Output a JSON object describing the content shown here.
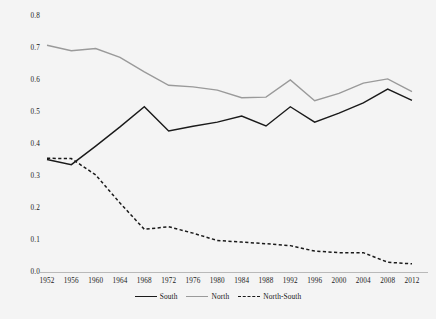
{
  "chart_data": {
    "type": "line",
    "title": "",
    "subtitle": "",
    "xlabel": "",
    "ylabel": "",
    "grid": false,
    "legend_position": "bottom-center",
    "x": [
      1952,
      1956,
      1960,
      1964,
      1968,
      1972,
      1976,
      1980,
      1984,
      1988,
      1992,
      1996,
      2000,
      2004,
      2008,
      2012
    ],
    "categories": [
      "1952",
      "1956",
      "1960",
      "1964",
      "1968",
      "1972",
      "1976",
      "1980",
      "1984",
      "1988",
      "1992",
      "1996",
      "2000",
      "2004",
      "2008",
      "2012"
    ],
    "xlim": [
      1952,
      2012
    ],
    "ylim": [
      0.0,
      0.8
    ],
    "y_ticks": [
      0.0,
      0.1,
      0.2,
      0.3,
      0.4,
      0.5,
      0.6,
      0.7,
      0.8
    ],
    "y_tick_labels": [
      "0.0",
      "0.1",
      "0.2",
      "0.3",
      "0.4",
      "0.5",
      "0.6",
      "0.7",
      "0.8"
    ],
    "series": [
      {
        "name": "South",
        "color": "#1a1a1a",
        "style": "solid",
        "values": [
          0.353,
          0.337,
          0.395,
          0.455,
          0.518,
          0.442,
          0.457,
          0.47,
          0.489,
          0.458,
          0.518,
          0.47,
          0.498,
          0.53,
          0.573,
          0.538
        ]
      },
      {
        "name": "North",
        "color": "#9a9a9a",
        "style": "solid",
        "values": [
          0.71,
          0.693,
          0.7,
          0.672,
          0.627,
          0.585,
          0.58,
          0.57,
          0.546,
          0.548,
          0.602,
          0.537,
          0.56,
          0.592,
          0.605,
          0.565
        ]
      },
      {
        "name": "North-South",
        "color": "#1a1a1a",
        "style": "dashed",
        "values": [
          0.357,
          0.356,
          0.305,
          0.217,
          0.135,
          0.143,
          0.123,
          0.1,
          0.095,
          0.09,
          0.084,
          0.067,
          0.062,
          0.062,
          0.032,
          0.027
        ]
      }
    ]
  },
  "legend": {
    "items": [
      {
        "label": "South",
        "color": "#1a1a1a",
        "style": "solid"
      },
      {
        "label": "North",
        "color": "#9a9a9a",
        "style": "solid"
      },
      {
        "label": "North-South",
        "color": "#1a1a1a",
        "style": "dashed"
      }
    ]
  },
  "axes": {
    "baseline_color": "#b9b9b9"
  }
}
